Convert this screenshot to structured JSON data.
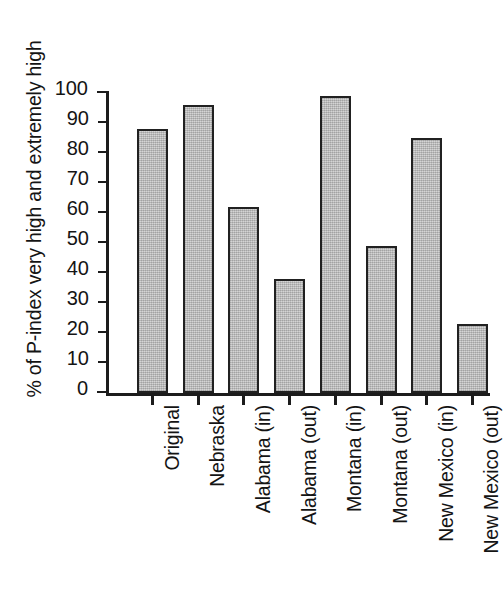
{
  "chart_data": {
    "type": "bar",
    "title": "",
    "xlabel": "",
    "ylabel": "% of P-index very high and extremely high",
    "ylim": [
      0,
      100
    ],
    "ytick_step": 10,
    "yticks": [
      "0",
      "10",
      "20",
      "30",
      "40",
      "50",
      "60",
      "70",
      "80",
      "90",
      "100"
    ],
    "grid": false,
    "legend": null,
    "categories": [
      "Original",
      "Nebraska",
      "Alabama (in)",
      "Alabama (out)",
      "Montana (in)",
      "Montana (out)",
      "New Mexico (in)",
      "New Mexico (out)"
    ],
    "values": [
      88,
      96,
      62,
      38,
      99,
      49,
      85,
      23
    ],
    "bar_fill_color": "#c9c9c9",
    "bar_border_color": "#212121",
    "axis_color": "#1c1c1c",
    "background_color": "#ffffff"
  }
}
